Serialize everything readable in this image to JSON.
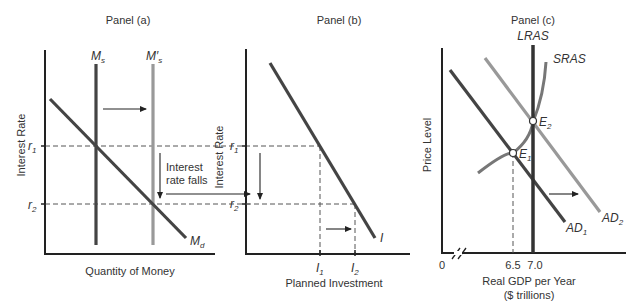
{
  "panel_a": {
    "title": "Panel (a)",
    "y_axis_label": "Interest Rate",
    "x_axis_label": "Quantity of Money",
    "curves": {
      "ms": "M",
      "ms_sub": "s",
      "ms_prime": "M′",
      "ms_prime_sub": "s",
      "md": "M",
      "md_sub": "d"
    },
    "ticks": {
      "r1": "r",
      "r1_sub": "1",
      "r2": "r",
      "r2_sub": "2"
    },
    "annotation_line1": "Interest",
    "annotation_line2": "rate falls"
  },
  "panel_b": {
    "title": "Panel (b)",
    "y_axis_label": "Interest Rate",
    "x_axis_label": "Planned Investment",
    "curve_label": "I",
    "ticks": {
      "r1": "r",
      "r1_sub": "1",
      "r2": "r",
      "r2_sub": "2",
      "i1": "I",
      "i1_sub": "1",
      "i2": "I",
      "i2_sub": "2"
    }
  },
  "panel_c": {
    "title": "Panel (c)",
    "y_axis_label": "Price Level",
    "x_axis_label_line1": "Real GDP per Year",
    "x_axis_label_line2": "($ trillions)",
    "curves": {
      "lras": "LRAS",
      "sras": "SRAS",
      "ad1": "AD",
      "ad1_sub": "1",
      "ad2": "AD",
      "ad2_sub": "2"
    },
    "points": {
      "e1": "E",
      "e1_sub": "1",
      "e2": "E",
      "e2_sub": "2"
    },
    "x_ticks": {
      "origin": "0",
      "t1": "6.5",
      "t2": "7.0"
    }
  }
}
